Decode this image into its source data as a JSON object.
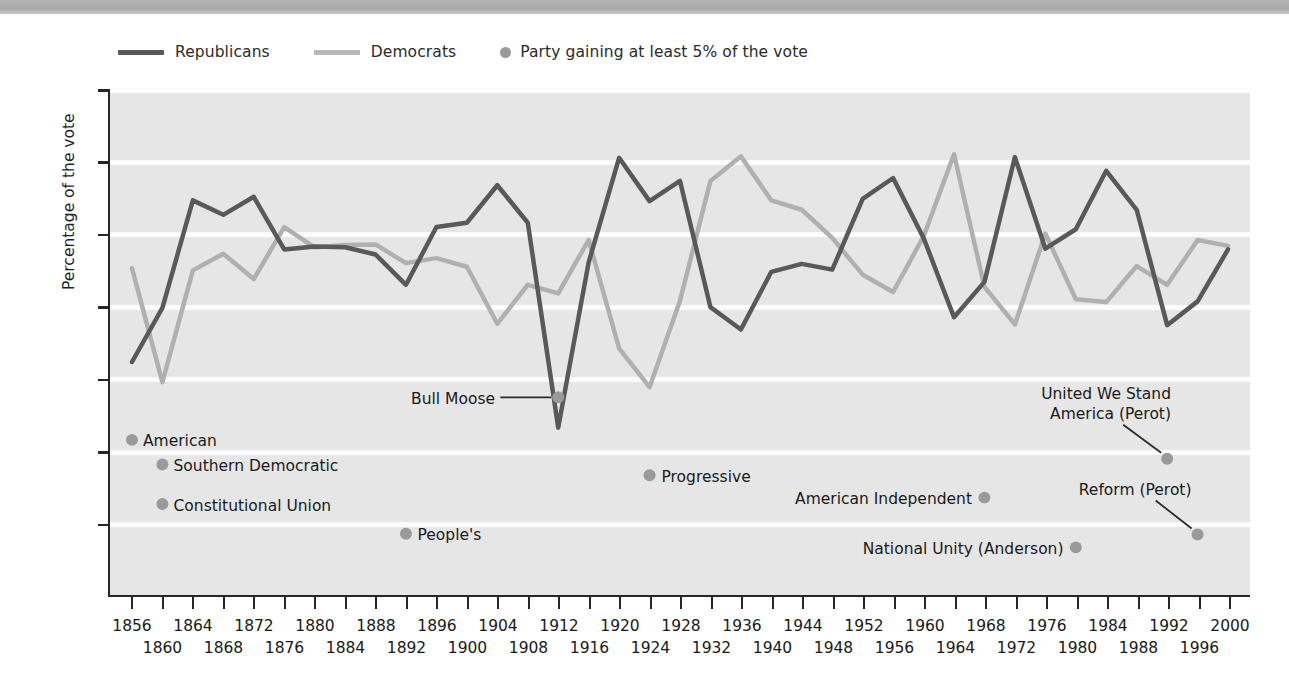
{
  "legend": {
    "items": [
      {
        "label": "Republicans",
        "type": "line",
        "color": "#595959"
      },
      {
        "label": "Democrats",
        "type": "line",
        "color": "#b0b0b0"
      },
      {
        "label": "Party gaining at least 5% of the vote",
        "type": "dot",
        "color": "#9a9a9a"
      }
    ]
  },
  "chart_data": {
    "type": "line",
    "title": "",
    "xlabel": "",
    "ylabel": "Percentage of the vote",
    "ylim": [
      0,
      70
    ],
    "yticks": [
      10,
      20,
      30,
      40,
      50,
      60,
      70
    ],
    "xlim": [
      1856,
      2000
    ],
    "grid": true,
    "legend_position": "top-left",
    "x": [
      1856,
      1860,
      1864,
      1868,
      1872,
      1876,
      1880,
      1884,
      1888,
      1892,
      1896,
      1900,
      1904,
      1908,
      1912,
      1916,
      1920,
      1924,
      1928,
      1932,
      1936,
      1940,
      1944,
      1948,
      1952,
      1956,
      1960,
      1964,
      1968,
      1972,
      1976,
      1980,
      1984,
      1988,
      1992,
      1996,
      2000
    ],
    "xticks_row0": [
      1856,
      1864,
      1872,
      1880,
      1888,
      1896,
      1904,
      1912,
      1920,
      1928,
      1936,
      1944,
      1952,
      1960,
      1968,
      1976,
      1984,
      1992,
      2000
    ],
    "xticks_row1": [
      1860,
      1868,
      1876,
      1884,
      1892,
      1900,
      1908,
      1916,
      1924,
      1932,
      1940,
      1948,
      1956,
      1964,
      1972,
      1980,
      1988,
      1996
    ],
    "series": [
      {
        "name": "Republicans",
        "color": "#595959",
        "values": [
          32.3,
          39.8,
          54.7,
          52.7,
          55.2,
          47.9,
          48.3,
          48.2,
          47.2,
          43.0,
          51.0,
          51.6,
          56.8,
          51.6,
          23.2,
          46.1,
          60.6,
          54.6,
          57.4,
          39.9,
          36.8,
          44.8,
          45.9,
          45.1,
          54.9,
          57.8,
          49.5,
          38.5,
          43.4,
          60.7,
          48.0,
          50.7,
          58.8,
          53.4,
          37.4,
          40.7,
          47.9
        ]
      },
      {
        "name": "Democrats",
        "color": "#b0b0b0",
        "values": [
          45.3,
          29.5,
          45.0,
          47.3,
          43.8,
          51.0,
          48.2,
          48.5,
          48.6,
          46.0,
          46.7,
          45.5,
          37.6,
          43.0,
          41.8,
          49.2,
          34.2,
          28.8,
          40.8,
          57.4,
          60.8,
          54.7,
          53.4,
          49.5,
          44.4,
          42.0,
          49.7,
          61.1,
          42.7,
          37.5,
          50.1,
          41.0,
          40.6,
          45.6,
          43.0,
          49.2,
          48.4
        ]
      }
    ],
    "third_party_points": [
      {
        "label": "American",
        "year": 1856,
        "value": 21.5
      },
      {
        "label": "Southern Democratic",
        "year": 1860,
        "value": 18.1
      },
      {
        "label": "Constitutional Union",
        "year": 1860,
        "value": 12.6
      },
      {
        "label": "People's",
        "year": 1892,
        "value": 8.5
      },
      {
        "label": "Bull Moose",
        "year": 1912,
        "value": 27.4
      },
      {
        "label": "Progressive",
        "year": 1924,
        "value": 16.6
      },
      {
        "label": "American Independent",
        "year": 1968,
        "value": 13.5
      },
      {
        "label": "National Unity (Anderson)",
        "year": 1980,
        "value": 6.6
      },
      {
        "label": "United We Stand America (Perot)",
        "year": 1992,
        "value": 18.9
      },
      {
        "label": "Reform (Perot)",
        "year": 1996,
        "value": 8.4
      }
    ]
  },
  "annotations": [
    {
      "name": "american",
      "text": "American",
      "align": "left"
    },
    {
      "name": "southern-democratic",
      "text": "Southern Democratic",
      "align": "left"
    },
    {
      "name": "constitutional-union",
      "text": "Constitutional Union",
      "align": "left"
    },
    {
      "name": "peoples",
      "text": "People's",
      "align": "left"
    },
    {
      "name": "bull-moose",
      "text": "Bull Moose",
      "align": "right"
    },
    {
      "name": "progressive",
      "text": "Progressive",
      "align": "left"
    },
    {
      "name": "american-independent",
      "text": "American Independent",
      "align": "right"
    },
    {
      "name": "national-unity",
      "text": "National Unity (Anderson)",
      "align": "right"
    },
    {
      "name": "united-we-stand-line1",
      "text": "United We Stand",
      "align": "right"
    },
    {
      "name": "united-we-stand-line2",
      "text": "America (Perot)",
      "align": "right"
    },
    {
      "name": "reform-perot",
      "text": "Reform (Perot)",
      "align": "right"
    }
  ],
  "colors": {
    "republican": "#595959",
    "democrat": "#b0b0b0",
    "third_party_dot": "#9a9a9a",
    "plot_background": "#e6e6e6",
    "gridline": "#fbfbfb",
    "axis": "#262626"
  }
}
